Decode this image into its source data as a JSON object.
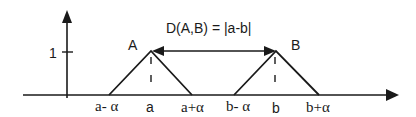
{
  "diagram": {
    "formula": "D(A,B) = |a-b|",
    "y_axis": {
      "tick_label": "1"
    },
    "sets": [
      {
        "name": "A",
        "center": "a",
        "left": "a- α",
        "right": "a+α"
      },
      {
        "name": "B",
        "center": "b",
        "left": "b- α",
        "right": "b+α"
      }
    ],
    "colors": {
      "stroke": "#1a1a1a",
      "background": "#ffffff"
    }
  }
}
